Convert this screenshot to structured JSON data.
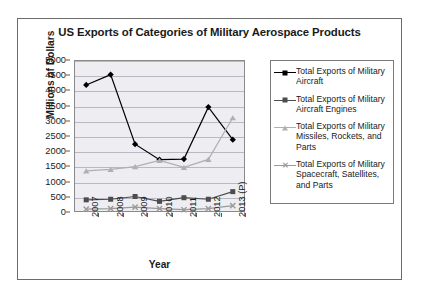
{
  "chart_data": {
    "type": "line",
    "title": "US Exports of Categories of Military Aerospace Products",
    "xlabel": "Year",
    "ylabel": "Millions of Dollars",
    "categories": [
      "2007",
      "2008",
      "2009",
      "2010",
      "2011",
      "2012",
      "2013 (P)"
    ],
    "ylim": [
      0,
      5000
    ],
    "yticks": [
      0,
      500,
      1000,
      1500,
      2000,
      2500,
      3000,
      3500,
      4000,
      4500,
      5000
    ],
    "grid": true,
    "legend_position": "right",
    "series": [
      {
        "name": "Total Exports of Military Aircraft",
        "marker": "diamond",
        "color": "#000000",
        "values": [
          4180,
          4520,
          2230,
          1720,
          1740,
          3450,
          2380
        ]
      },
      {
        "name": "Total Exports of Military Aircraft Engines",
        "marker": "square",
        "color": "#4d4d4d",
        "values": [
          400,
          420,
          510,
          350,
          470,
          420,
          670
        ]
      },
      {
        "name": "Total Exports of Military Missiles, Rockets, and Parts",
        "marker": "triangle",
        "color": "#b0b0b0",
        "values": [
          1350,
          1400,
          1490,
          1700,
          1470,
          1730,
          3100
        ]
      },
      {
        "name": "Total Exports of Military Spacecraft, Satellites, and Parts",
        "marker": "x",
        "color": "#9a9a9a",
        "values": [
          95,
          110,
          160,
          110,
          75,
          110,
          210
        ]
      }
    ]
  },
  "legend": {
    "entries": [
      "Total Exports of Military Aircraft",
      "Total Exports of Military Aircraft Engines",
      "Total Exports of Military Missiles, Rockets, and Parts",
      "Total Exports of Military Spacecraft, Satellites, and Parts"
    ]
  }
}
